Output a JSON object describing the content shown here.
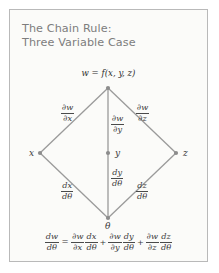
{
  "card": {
    "background": "#fbfbf9",
    "border_color": "#b9b9b9"
  },
  "title": {
    "line1": "The Chain Rule:",
    "line2": "Three Variable Case",
    "color": "#7d7d7d"
  },
  "diagram": {
    "type": "tree",
    "line_color": "#9a9a9a",
    "node_color": "#8c8c8c",
    "root": {
      "id": "w",
      "label": "w = f(x, y, z)",
      "x": 98,
      "y": 78
    },
    "middle_nodes": [
      {
        "id": "x",
        "label": "x",
        "x": 30,
        "y": 143
      },
      {
        "id": "y",
        "label": "y",
        "x": 98,
        "y": 143
      },
      {
        "id": "z",
        "label": "z",
        "x": 166,
        "y": 143
      }
    ],
    "leaf": {
      "id": "theta",
      "label": "θ",
      "x": 98,
      "y": 208
    },
    "upper_edges": [
      {
        "from": "w",
        "to": "x",
        "numerator": "∂w",
        "denominator": "∂x",
        "label_x": 56,
        "label_y": 98
      },
      {
        "from": "w",
        "to": "y",
        "numerator": "∂w",
        "denominator": "∂y",
        "label_x": 104,
        "label_y": 106
      },
      {
        "from": "w",
        "to": "z",
        "numerator": "∂w",
        "denominator": "∂z",
        "label_x": 128,
        "label_y": 98
      }
    ],
    "lower_edges": [
      {
        "from": "x",
        "to": "theta",
        "numerator": "dx",
        "denominator": "dθ",
        "label_x": 56,
        "label_y": 176
      },
      {
        "from": "y",
        "to": "theta",
        "numerator": "dy",
        "denominator": "dθ",
        "label_x": 104,
        "label_y": 162
      },
      {
        "from": "z",
        "to": "theta",
        "numerator": "dz",
        "denominator": "dθ",
        "label_x": 128,
        "label_y": 176
      }
    ]
  },
  "equation": {
    "lhs": {
      "numerator": "dw",
      "denominator": "dθ"
    },
    "equals": "=",
    "terms": [
      {
        "first": {
          "numerator": "∂w",
          "denominator": "∂x"
        },
        "second": {
          "numerator": "dx",
          "denominator": "dθ"
        }
      },
      {
        "first": {
          "numerator": "∂w",
          "denominator": "∂y"
        },
        "second": {
          "numerator": "dy",
          "denominator": "dθ"
        }
      },
      {
        "first": {
          "numerator": "∂w",
          "denominator": "∂z"
        },
        "second": {
          "numerator": "dz",
          "denominator": "dθ"
        }
      }
    ],
    "plus": "+"
  }
}
